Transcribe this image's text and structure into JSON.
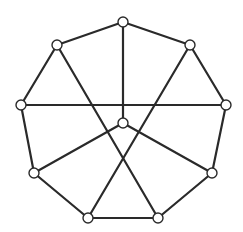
{
  "diagram": {
    "type": "graph",
    "width": 243,
    "height": 232,
    "colors": {
      "edge": "#2a2a2a",
      "node_fill": "#ffffff",
      "node_stroke": "#2a2a2a",
      "background": "#ffffff"
    },
    "node_radius": 5,
    "nodes": [
      {
        "id": "top",
        "x": 123,
        "y": 22
      },
      {
        "id": "upper-right",
        "x": 190,
        "y": 45
      },
      {
        "id": "right",
        "x": 226,
        "y": 105
      },
      {
        "id": "lower-right",
        "x": 212,
        "y": 173
      },
      {
        "id": "bottom-right",
        "x": 158,
        "y": 218
      },
      {
        "id": "bottom-left",
        "x": 88,
        "y": 218
      },
      {
        "id": "lower-left",
        "x": 34,
        "y": 173
      },
      {
        "id": "left",
        "x": 21,
        "y": 105
      },
      {
        "id": "upper-left",
        "x": 57,
        "y": 45
      },
      {
        "id": "center",
        "x": 123,
        "y": 123
      }
    ],
    "edges": [
      [
        "top",
        "upper-right"
      ],
      [
        "upper-right",
        "right"
      ],
      [
        "right",
        "lower-right"
      ],
      [
        "lower-right",
        "bottom-right"
      ],
      [
        "bottom-right",
        "bottom-left"
      ],
      [
        "bottom-left",
        "lower-left"
      ],
      [
        "lower-left",
        "left"
      ],
      [
        "left",
        "upper-left"
      ],
      [
        "upper-left",
        "top"
      ],
      [
        "top",
        "center"
      ],
      [
        "left",
        "right"
      ],
      [
        "upper-left",
        "bottom-right"
      ],
      [
        "upper-right",
        "bottom-left"
      ],
      [
        "center",
        "lower-left"
      ],
      [
        "center",
        "lower-right"
      ]
    ]
  }
}
